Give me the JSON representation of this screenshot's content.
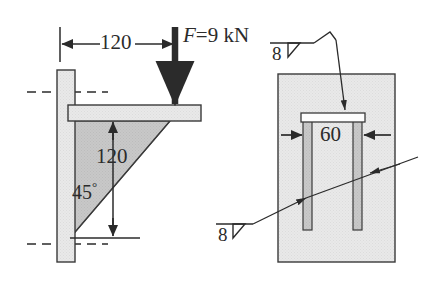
{
  "figure": {
    "type": "engineering-drawing",
    "background_color": "#ffffff",
    "line_color": "#2b2b2b",
    "plate_fill": "#e8e8e8",
    "gusset_fill": "#c9c9c9",
    "wall_fill": "#e2e2e2"
  },
  "side_view": {
    "dim_horizontal": {
      "label": "120",
      "unit_implied": "mm",
      "from_x": 57,
      "to_x": 175
    },
    "force": {
      "label": "F=9 kN",
      "symbol": "F",
      "equals": "=",
      "magnitude": "9",
      "unit": "kN",
      "direction": "down",
      "applied_at_x": 175
    },
    "dim_vertical": {
      "label": "120",
      "unit_implied": "mm",
      "from_y": 121,
      "to_y": 238
    },
    "angle": {
      "value": "45",
      "degree_symbol": "°",
      "label": "45°"
    },
    "parts": {
      "wall_plate": "vertical-wall-plate",
      "top_plate": "horizontal-top-plate",
      "gusset": "triangular-gusset-plate"
    },
    "centerlines": [
      {
        "name": "upper-centerline",
        "y": 92
      },
      {
        "name": "lower-centerline",
        "y": 244
      }
    ]
  },
  "front_view": {
    "dim_width": {
      "label": "60",
      "unit_implied": "mm"
    },
    "parts": {
      "wall": "wall-rectangle",
      "top_plate": "horizontal-top-plate",
      "gusset_left": "left-gusset-plate",
      "gusset_right": "right-gusset-plate"
    },
    "weld_symbols": [
      {
        "name": "weld-symbol-top",
        "size": "8",
        "weld_type": "fillet",
        "points_to": "top-plate-weld"
      },
      {
        "name": "weld-symbol-bottom",
        "size": "8",
        "weld_type": "fillet",
        "points_to": "gusset-plate-weld"
      }
    ]
  }
}
